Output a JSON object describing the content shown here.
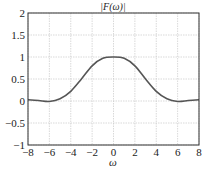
{
  "chart_data": {
    "type": "line",
    "title": "|F(ω)|",
    "xlabel": "ω",
    "ylabel": "",
    "xlim": [
      -8,
      8
    ],
    "ylim": [
      -1,
      2
    ],
    "xticks": [
      -8,
      -6,
      -4,
      -2,
      0,
      2,
      4,
      6,
      8
    ],
    "xtick_labels": [
      "−8",
      "−6",
      "−4",
      "−2",
      "0",
      "2",
      "4",
      "6",
      "8"
    ],
    "yticks": [
      -1,
      -0.5,
      0,
      0.5,
      1,
      1.5,
      2
    ],
    "ytick_labels": [
      "−1",
      "−0.5",
      "0",
      "0.5",
      "1",
      "1.5",
      "2"
    ],
    "grid": true,
    "legend": null,
    "series": [
      {
        "name": "|F(ω)|",
        "color": "#555555",
        "x": [
          -8,
          -7,
          -6,
          -5,
          -4,
          -3,
          -2,
          -1,
          0,
          1,
          2,
          3,
          4,
          5,
          6,
          7,
          8
        ],
        "y": [
          0.03,
          0.01,
          -0.01,
          0.05,
          0.22,
          0.5,
          0.8,
          0.97,
          1.0,
          0.97,
          0.8,
          0.5,
          0.22,
          0.05,
          -0.01,
          0.01,
          0.03
        ]
      }
    ]
  }
}
